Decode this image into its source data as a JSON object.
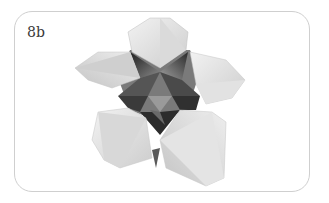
{
  "figure": {
    "label": "8b",
    "colors": {
      "frame_border": "#cfcfcf",
      "background": "#ffffff",
      "petal_light": "#e6e6e6",
      "petal_mid": "#c8c8c8",
      "center_dark": "#3a3a3a"
    }
  }
}
